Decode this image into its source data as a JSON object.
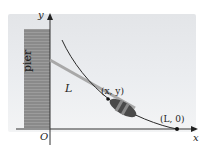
{
  "diagram": {
    "axes": {
      "x_label": "x",
      "y_label": "y",
      "origin_label": "O"
    },
    "pier": {
      "label": "pier",
      "color": "#8d8d8d"
    },
    "rope": {
      "label": "L",
      "color": "#a0a0a0"
    },
    "curve": {
      "color": "#2a2a2a"
    },
    "points": [
      {
        "id": "boat",
        "label": "(x, y)"
      },
      {
        "id": "end",
        "label": "(L, 0)"
      }
    ],
    "colors": {
      "background": "#e6e8ea",
      "axis": "#333333",
      "boat": "#4a4a4a"
    }
  }
}
